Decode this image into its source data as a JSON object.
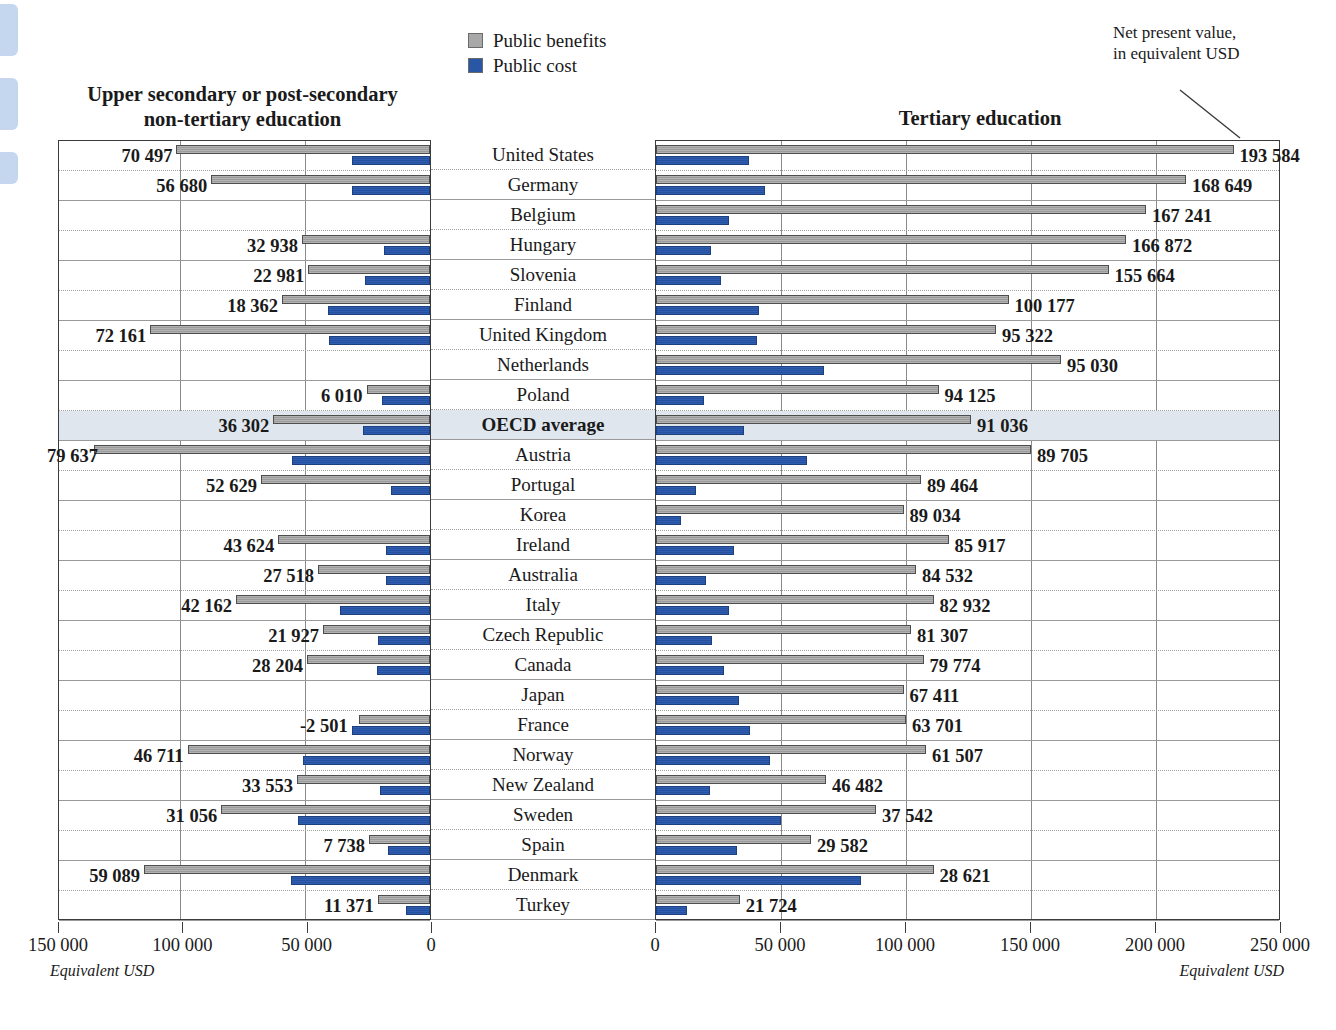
{
  "legend": {
    "items": [
      {
        "label": "Public benefits",
        "color": "#a8a8a8",
        "icon": "square-swatch-icon"
      },
      {
        "label": "Public cost",
        "color": "#2a57a5",
        "icon": "square-swatch-icon"
      }
    ]
  },
  "titles": {
    "left": "Upper secondary or post-secondary non-tertiary education",
    "left_line1": "Upper secondary or post-secondary",
    "left_line2": "non-tertiary education",
    "right": "Tertiary education",
    "npv_note_line1": "Net present value,",
    "npv_note_line2": "in equivalent USD"
  },
  "axes": {
    "left": {
      "unit": "Equivalent USD",
      "ticks": [
        "150 000",
        "100 000",
        "50 000",
        "0"
      ],
      "tick_values": [
        150000,
        100000,
        50000,
        0
      ],
      "max": 150000
    },
    "right": {
      "unit": "Equivalent USD",
      "ticks": [
        "0",
        "50 000",
        "100 000",
        "150 000",
        "200 000",
        "250 000"
      ],
      "tick_values": [
        0,
        50000,
        100000,
        150000,
        200000,
        250000
      ],
      "max": 250000
    }
  },
  "chart_data": {
    "type": "bar",
    "orientation": "horizontal-diverging",
    "xlabel": "Equivalent USD",
    "ylabel": "",
    "grid": true,
    "legend_position": "top-center",
    "left_panel": {
      "title": "Upper secondary or post-secondary non-tertiary education",
      "xlim": [
        0,
        150000
      ],
      "direction": "right-to-left",
      "series": [
        {
          "name": "Public benefits",
          "color": "#a8a8a8"
        },
        {
          "name": "Public cost",
          "color": "#2a57a5"
        }
      ]
    },
    "right_panel": {
      "title": "Tertiary education",
      "xlim": [
        0,
        250000
      ],
      "direction": "left-to-right",
      "series": [
        {
          "name": "Public benefits",
          "color": "#a8a8a8"
        },
        {
          "name": "Public cost",
          "color": "#2a57a5"
        }
      ]
    },
    "categories": [
      "United States",
      "Germany",
      "Belgium",
      "Hungary",
      "Slovenia",
      "Finland",
      "United Kingdom",
      "Netherlands",
      "Poland",
      "OECD average",
      "Austria",
      "Portugal",
      "Korea",
      "Ireland",
      "Australia",
      "Italy",
      "Czech Republic",
      "Canada",
      "Japan",
      "France",
      "Norway",
      "New Zealand",
      "Sweden",
      "Spain",
      "Denmark",
      "Turkey"
    ],
    "rows": [
      {
        "country": "United States",
        "highlight": false,
        "left": {
          "net_label": "70 497",
          "net": 70497,
          "benefits": 102000,
          "cost": 31500
        },
        "right": {
          "net_label": "193 584",
          "net": 193584,
          "benefits": 231000,
          "cost": 37000
        }
      },
      {
        "country": "Germany",
        "highlight": false,
        "left": {
          "net_label": "56 680",
          "net": 56680,
          "benefits": 88000,
          "cost": 31500
        },
        "right": {
          "net_label": "168 649",
          "net": 168649,
          "benefits": 212000,
          "cost": 43500
        }
      },
      {
        "country": "Belgium",
        "highlight": false,
        "left": {
          "net_label": "",
          "net": null,
          "benefits": 0,
          "cost": 0
        },
        "right": {
          "net_label": "167 241",
          "net": 167241,
          "benefits": 196000,
          "cost": 29000
        }
      },
      {
        "country": "Hungary",
        "highlight": false,
        "left": {
          "net_label": "32 938",
          "net": 32938,
          "benefits": 51500,
          "cost": 18500
        },
        "right": {
          "net_label": "166 872",
          "net": 166872,
          "benefits": 188000,
          "cost": 22000
        }
      },
      {
        "country": "Slovenia",
        "highlight": false,
        "left": {
          "net_label": "22 981",
          "net": 22981,
          "benefits": 49000,
          "cost": 26000
        },
        "right": {
          "net_label": "155 664",
          "net": 155664,
          "benefits": 181000,
          "cost": 26000
        }
      },
      {
        "country": "Finland",
        "highlight": false,
        "left": {
          "net_label": "18 362",
          "net": 18362,
          "benefits": 59500,
          "cost": 41000
        },
        "right": {
          "net_label": "100 177",
          "net": 100177,
          "benefits": 141000,
          "cost": 41000
        }
      },
      {
        "country": "United Kingdom",
        "highlight": false,
        "left": {
          "net_label": "72 161",
          "net": 72161,
          "benefits": 112500,
          "cost": 40500
        },
        "right": {
          "net_label": "95 322",
          "net": 95322,
          "benefits": 136000,
          "cost": 40500
        }
      },
      {
        "country": "Netherlands",
        "highlight": false,
        "left": {
          "net_label": "",
          "net": null,
          "benefits": 0,
          "cost": 0
        },
        "right": {
          "net_label": "95 030",
          "net": 95030,
          "benefits": 162000,
          "cost": 67000
        }
      },
      {
        "country": "Poland",
        "highlight": false,
        "left": {
          "net_label": "6 010",
          "net": 6010,
          "benefits": 25500,
          "cost": 19500
        },
        "right": {
          "net_label": "94 125",
          "net": 94125,
          "benefits": 113000,
          "cost": 19000
        }
      },
      {
        "country": "OECD average",
        "highlight": true,
        "left": {
          "net_label": "36 302",
          "net": 36302,
          "benefits": 63000,
          "cost": 27000
        },
        "right": {
          "net_label": "91 036",
          "net": 91036,
          "benefits": 126000,
          "cost": 35000
        }
      },
      {
        "country": "Austria",
        "highlight": false,
        "left": {
          "net_label": "79 637",
          "net": 79637,
          "benefits": 135000,
          "cost": 55500
        },
        "right": {
          "net_label": "89 705",
          "net": 89705,
          "benefits": 150000,
          "cost": 60500
        }
      },
      {
        "country": "Portugal",
        "highlight": false,
        "left": {
          "net_label": "52 629",
          "net": 52629,
          "benefits": 68000,
          "cost": 15500
        },
        "right": {
          "net_label": "89 464",
          "net": 89464,
          "benefits": 106000,
          "cost": 16000
        }
      },
      {
        "country": "Korea",
        "highlight": false,
        "left": {
          "net_label": "",
          "net": null,
          "benefits": 0,
          "cost": 0
        },
        "right": {
          "net_label": "89 034",
          "net": 89034,
          "benefits": 99000,
          "cost": 10000
        }
      },
      {
        "country": "Ireland",
        "highlight": false,
        "left": {
          "net_label": "43 624",
          "net": 43624,
          "benefits": 61000,
          "cost": 17500
        },
        "right": {
          "net_label": "85 917",
          "net": 85917,
          "benefits": 117000,
          "cost": 31000
        }
      },
      {
        "country": "Australia",
        "highlight": false,
        "left": {
          "net_label": "27 518",
          "net": 27518,
          "benefits": 45000,
          "cost": 17500
        },
        "right": {
          "net_label": "84 532",
          "net": 84532,
          "benefits": 104000,
          "cost": 20000
        }
      },
      {
        "country": "Italy",
        "highlight": false,
        "left": {
          "net_label": "42 162",
          "net": 42162,
          "benefits": 78000,
          "cost": 36000
        },
        "right": {
          "net_label": "82 932",
          "net": 82932,
          "benefits": 111000,
          "cost": 29000
        }
      },
      {
        "country": "Czech Republic",
        "highlight": false,
        "left": {
          "net_label": "21 927",
          "net": 21927,
          "benefits": 43000,
          "cost": 21000
        },
        "right": {
          "net_label": "81 307",
          "net": 81307,
          "benefits": 102000,
          "cost": 22500
        }
      },
      {
        "country": "Canada",
        "highlight": false,
        "left": {
          "net_label": "28 204",
          "net": 28204,
          "benefits": 49500,
          "cost": 21500
        },
        "right": {
          "net_label": "79 774",
          "net": 79774,
          "benefits": 107000,
          "cost": 27000
        }
      },
      {
        "country": "Japan",
        "highlight": false,
        "left": {
          "net_label": "",
          "net": null,
          "benefits": 0,
          "cost": 0
        },
        "right": {
          "net_label": "67 411",
          "net": 67411,
          "benefits": 99000,
          "cost": 33000
        }
      },
      {
        "country": "France",
        "highlight": false,
        "left": {
          "net_label": "-2 501",
          "net": -2501,
          "benefits": 28500,
          "cost": 31500
        },
        "right": {
          "net_label": "63 701",
          "net": 63701,
          "benefits": 100000,
          "cost": 37500
        }
      },
      {
        "country": "Norway",
        "highlight": false,
        "left": {
          "net_label": "46 711",
          "net": 46711,
          "benefits": 97500,
          "cost": 51000
        },
        "right": {
          "net_label": "61 507",
          "net": 61507,
          "benefits": 108000,
          "cost": 45500
        }
      },
      {
        "country": "New Zealand",
        "highlight": false,
        "left": {
          "net_label": "33 553",
          "net": 33553,
          "benefits": 53500,
          "cost": 20000
        },
        "right": {
          "net_label": "46 482",
          "net": 46482,
          "benefits": 68000,
          "cost": 21500
        }
      },
      {
        "country": "Sweden",
        "highlight": false,
        "left": {
          "net_label": "31 056",
          "net": 31056,
          "benefits": 84000,
          "cost": 53000
        },
        "right": {
          "net_label": "37 542",
          "net": 37542,
          "benefits": 88000,
          "cost": 50000
        }
      },
      {
        "country": "Spain",
        "highlight": false,
        "left": {
          "net_label": "7 738",
          "net": 7738,
          "benefits": 24500,
          "cost": 17000
        },
        "right": {
          "net_label": "29 582",
          "net": 29582,
          "benefits": 62000,
          "cost": 32500
        }
      },
      {
        "country": "Denmark",
        "highlight": false,
        "left": {
          "net_label": "59 089",
          "net": 59089,
          "benefits": 115000,
          "cost": 56000
        },
        "right": {
          "net_label": "28 621",
          "net": 28621,
          "benefits": 111000,
          "cost": 82000
        }
      },
      {
        "country": "Turkey",
        "highlight": false,
        "left": {
          "net_label": "11 371",
          "net": 11371,
          "benefits": 21000,
          "cost": 9500
        },
        "right": {
          "net_label": "21 724",
          "net": 21724,
          "benefits": 33500,
          "cost": 12500
        }
      }
    ]
  }
}
